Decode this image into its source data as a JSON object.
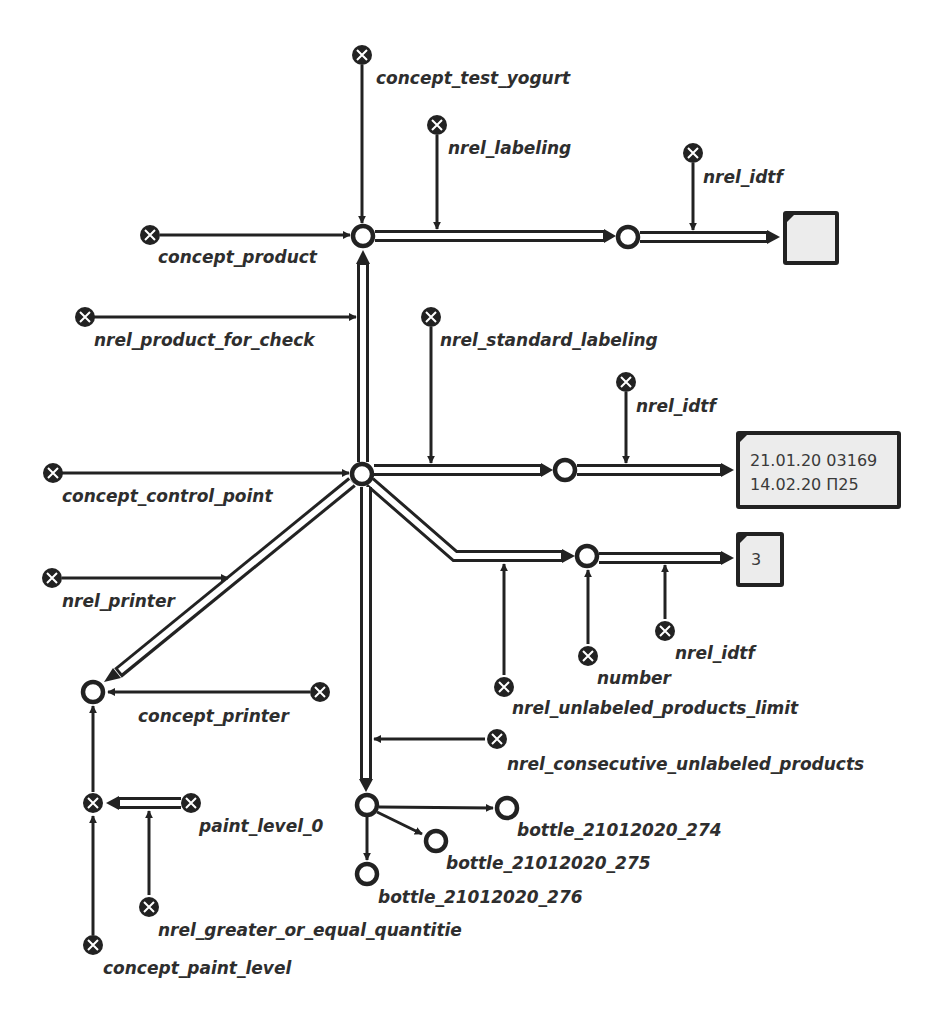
{
  "diagram": {
    "type": "semantic-network",
    "colors": {
      "stroke": "#222222",
      "box_fill": "#ececec",
      "label": "#2e2e2e",
      "background": "#ffffff"
    },
    "nodes": {
      "concept_test_yogurt": {
        "label": "concept_test_yogurt",
        "kind": "class"
      },
      "nrel_labeling": {
        "label": "nrel_labeling",
        "kind": "relation"
      },
      "nrel_idtf_1": {
        "label": "nrel_idtf",
        "kind": "relation"
      },
      "concept_product": {
        "label": "concept_product",
        "kind": "class"
      },
      "nrel_product_for_check": {
        "label": "nrel_product_for_check",
        "kind": "relation"
      },
      "nrel_standard_labeling": {
        "label": "nrel_standard_labeling",
        "kind": "relation"
      },
      "nrel_idtf_2": {
        "label": "nrel_idtf",
        "kind": "relation"
      },
      "concept_control_point": {
        "label": "concept_control_point",
        "kind": "class"
      },
      "nrel_printer": {
        "label": "nrel_printer",
        "kind": "relation"
      },
      "nrel_idtf_3": {
        "label": "nrel_idtf",
        "kind": "relation"
      },
      "number": {
        "label": "number",
        "kind": "class"
      },
      "nrel_unlabeled_products_limit": {
        "label": "nrel_unlabeled_products_limit",
        "kind": "relation"
      },
      "concept_printer": {
        "label": "concept_printer",
        "kind": "class"
      },
      "nrel_consecutive_unlabeled_products": {
        "label": "nrel_consecutive_unlabeled_products",
        "kind": "relation"
      },
      "paint_level_0": {
        "label": "paint_level_0",
        "kind": "class"
      },
      "bottle_21012020_274": {
        "label": "bottle_21012020_274",
        "kind": "instance"
      },
      "bottle_21012020_275": {
        "label": "bottle_21012020_275",
        "kind": "instance"
      },
      "bottle_21012020_276": {
        "label": "bottle_21012020_276",
        "kind": "instance"
      },
      "nrel_greater_or_equal_quantitie": {
        "label": "nrel_greater_or_equal_quantitie",
        "kind": "relation"
      },
      "concept_paint_level": {
        "label": "concept_paint_level",
        "kind": "class"
      }
    },
    "links": {
      "box_top": {
        "line1": "",
        "line2": ""
      },
      "box_dates": {
        "line1": "21.01.20 03169",
        "line2": "14.02.20 П25"
      },
      "box_number": {
        "line1": "3"
      }
    }
  }
}
